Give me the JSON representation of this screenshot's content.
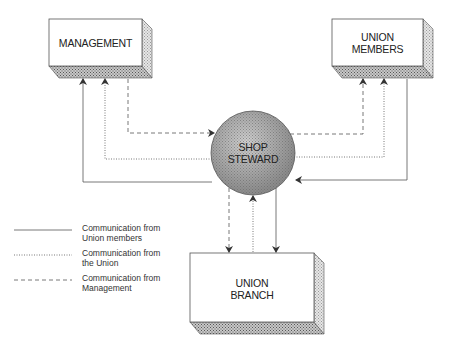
{
  "nodes": {
    "management": {
      "label": "MANAGEMENT"
    },
    "union_members": {
      "label_line1": "UNION",
      "label_line2": "MEMBERS"
    },
    "shop_steward": {
      "label_line1": "SHOP",
      "label_line2": "STEWARD"
    },
    "union_branch": {
      "label_line1": "UNION",
      "label_line2": "BRANCH"
    }
  },
  "legend": [
    {
      "style": "solid",
      "line1": "Communication from",
      "line2": "Union members"
    },
    {
      "style": "dotted",
      "line1": "Communication from",
      "line2": "the Union"
    },
    {
      "style": "dashed",
      "line1": "Communication from",
      "line2": "Management"
    }
  ],
  "edges": [
    {
      "from": "Shop Steward",
      "to": "Management",
      "style": "solid"
    },
    {
      "from": "Shop Steward",
      "to": "Management",
      "style": "dotted"
    },
    {
      "from": "Management",
      "to": "Shop Steward",
      "style": "dashed"
    },
    {
      "from": "Shop Steward",
      "to": "Union Members",
      "style": "dashed"
    },
    {
      "from": "Shop Steward",
      "to": "Union Members",
      "style": "dotted"
    },
    {
      "from": "Union Members",
      "to": "Shop Steward",
      "style": "solid"
    },
    {
      "from": "Shop Steward",
      "to": "Union Branch",
      "style": "dashed"
    },
    {
      "from": "Union Branch",
      "to": "Shop Steward",
      "style": "dotted"
    },
    {
      "from": "Shop Steward",
      "to": "Union Branch",
      "style": "solid"
    }
  ],
  "colors": {
    "line": "#555555",
    "shade": "#8a8a8a",
    "circle": "#9a9a9a"
  }
}
